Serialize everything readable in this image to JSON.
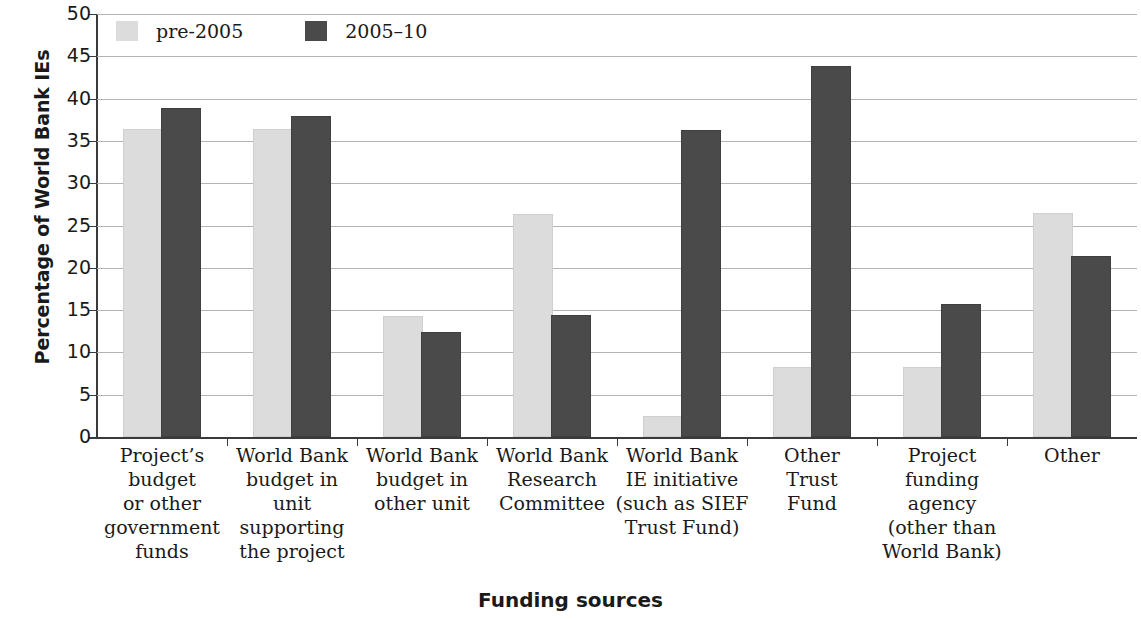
{
  "chart_data": {
    "type": "bar",
    "title": "",
    "xlabel": "Funding sources",
    "ylabel": "Percentage of World Bank IEs",
    "ylim": [
      0,
      50
    ],
    "ytick_step": 5,
    "yticks": [
      "50",
      "45",
      "40",
      "35",
      "30",
      "25",
      "20",
      "15",
      "10",
      "5",
      "0"
    ],
    "grid": true,
    "legend_position": "top-left",
    "categories": [
      "Project's\nbudget\nor other\ngovernment\nfunds",
      "World Bank\nbudget in\nunit\nsupporting\nthe project",
      "World Bank\nbudget in\nother unit",
      "World Bank\nResearch\nCommittee",
      "World Bank\nIE initiative\n(such as SIEF\nTrust Fund)",
      "Other\nTrust\nFund",
      "Project\nfunding\nagency\n(other than\nWorld Bank)",
      "Other"
    ],
    "series": [
      {
        "name": "pre-2005",
        "color": "#dcdcdc",
        "values": [
          36.2,
          36.2,
          14.1,
          26.1,
          2.2,
          8.0,
          8.0,
          26.2
        ]
      },
      {
        "name": "2005–10",
        "color": "#4a4a4a",
        "values": [
          38.6,
          37.7,
          12.2,
          14.2,
          36.0,
          43.6,
          15.5,
          21.2
        ]
      }
    ]
  },
  "legend": {
    "items": [
      {
        "label": "pre-2005"
      },
      {
        "label": "2005–10"
      }
    ]
  },
  "axes": {
    "y_title": "Percentage of World Bank IEs",
    "x_title": "Funding sources"
  },
  "categories_display": [
    [
      "Project’s",
      "budget",
      "or other",
      "government",
      "funds"
    ],
    [
      "World Bank",
      "budget in",
      "unit",
      "supporting",
      "the project"
    ],
    [
      "World Bank",
      "budget in",
      "other unit"
    ],
    [
      "World Bank",
      "Research",
      "Committee"
    ],
    [
      "World Bank",
      "IE initiative",
      "(such as SIEF",
      "Trust Fund)"
    ],
    [
      "Other",
      "Trust",
      "Fund"
    ],
    [
      "Project",
      "funding",
      "agency",
      "(other than",
      "World Bank)"
    ],
    [
      "Other"
    ]
  ]
}
